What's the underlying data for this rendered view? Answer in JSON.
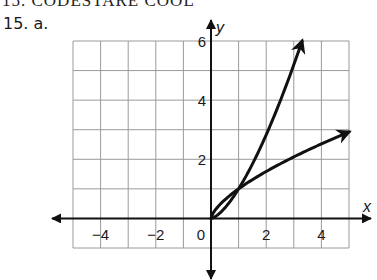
{
  "header": {
    "cropped_title": "15. CODESTARE COOL",
    "problem_label": "15. a."
  },
  "chart_data": {
    "type": "line",
    "title": "",
    "xlabel": "x",
    "ylabel": "y",
    "xlim": [
      -5,
      5
    ],
    "ylim": [
      -1,
      6
    ],
    "grid": true,
    "grid_step": 1,
    "x_ticks": [
      -4,
      -2,
      0,
      2,
      4
    ],
    "x_tick_labels": [
      "−4",
      "−2",
      "0",
      "2",
      "4"
    ],
    "y_ticks": [
      2,
      4,
      6
    ],
    "y_tick_labels": [
      "2",
      "4",
      "6"
    ],
    "legend": null,
    "series": [
      {
        "name": "steep curve (y = x^1.5)",
        "x": [
          0,
          0.5,
          1,
          1.5,
          2,
          2.5,
          3,
          3.3
        ],
        "y": [
          0,
          0.35,
          1,
          1.84,
          2.83,
          3.95,
          5.2,
          6.0
        ],
        "end_arrow": true
      },
      {
        "name": "flatter curve (y = x^(2/3))",
        "x": [
          0,
          0.5,
          1,
          2,
          3,
          4,
          5
        ],
        "y": [
          0,
          0.63,
          1,
          1.59,
          2.08,
          2.52,
          2.92
        ],
        "end_arrow": true
      }
    ],
    "intersection": [
      1,
      1
    ],
    "colors": {
      "grid": "#9a9a9a",
      "axes": "#111111",
      "curves": "#111111"
    }
  }
}
